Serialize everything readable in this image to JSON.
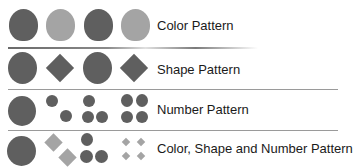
{
  "colors": {
    "dark": "#5e5e5e",
    "light": "#a3a3a3",
    "mid_diamond": "#686868",
    "divider": "#9a9a9a"
  },
  "rows": [
    {
      "label": "Color Pattern",
      "shapes": [
        "dark-circle",
        "light-circle",
        "dark-circle",
        "light-circle"
      ]
    },
    {
      "label": "Shape Pattern",
      "shapes": [
        "circle",
        "diamond",
        "circle",
        "diamond"
      ]
    },
    {
      "label": "Number Pattern",
      "shapes": [
        "1 large circle",
        "2 circles",
        "3 circles",
        "4 circles"
      ]
    },
    {
      "label": "Color, Shape and Number Pattern",
      "shapes": [
        "1 dark circle",
        "2 light diamonds",
        "3 dark circles",
        "4 light diamonds"
      ]
    }
  ]
}
